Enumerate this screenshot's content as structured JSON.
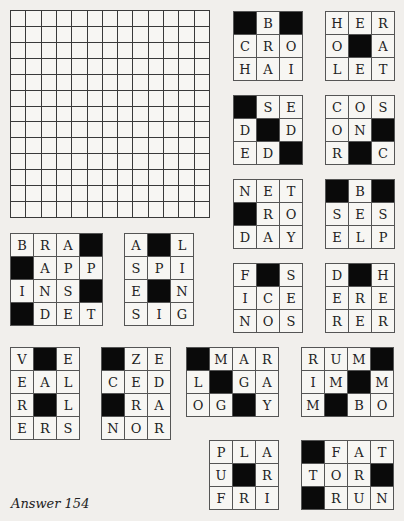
{
  "puzzle": {
    "answer_label": "Answer 154",
    "main_grid": {
      "rows": 13,
      "cols": 13
    },
    "colors": {
      "block": "#0a0a0a",
      "cell": "#f7f6f3",
      "line": "#3a3a3a",
      "page": "#f1efec"
    },
    "pieces": [
      {
        "id": "piece-1",
        "x": 233,
        "y": 11,
        "cols": 3,
        "rows": 3,
        "cells": [
          "#",
          "B",
          "#",
          "C",
          "R",
          "O",
          "H",
          "A",
          "I"
        ]
      },
      {
        "id": "piece-2",
        "x": 325,
        "y": 11,
        "cols": 3,
        "rows": 3,
        "cells": [
          "H",
          "E",
          "R",
          "O",
          "#",
          "A",
          "L",
          "E",
          "T"
        ]
      },
      {
        "id": "piece-3",
        "x": 233,
        "y": 95,
        "cols": 3,
        "rows": 3,
        "cells": [
          "#",
          "S",
          "E",
          "D",
          "#",
          "D",
          "E",
          "D",
          "#"
        ]
      },
      {
        "id": "piece-4",
        "x": 325,
        "y": 95,
        "cols": 3,
        "rows": 3,
        "cells": [
          "C",
          "O",
          "S",
          "O",
          "N",
          "#",
          "R",
          "#",
          "C"
        ]
      },
      {
        "id": "piece-5",
        "x": 233,
        "y": 179,
        "cols": 3,
        "rows": 3,
        "cells": [
          "N",
          "E",
          "T",
          "#",
          "R",
          "O",
          "D",
          "A",
          "Y"
        ]
      },
      {
        "id": "piece-6",
        "x": 325,
        "y": 179,
        "cols": 3,
        "rows": 3,
        "cells": [
          "#",
          "B",
          "#",
          "S",
          "E",
          "S",
          "E",
          "L",
          "P"
        ]
      },
      {
        "id": "piece-7",
        "x": 233,
        "y": 263,
        "cols": 3,
        "rows": 3,
        "cells": [
          "F",
          "#",
          "S",
          "I",
          "C",
          "E",
          "N",
          "O",
          "S"
        ]
      },
      {
        "id": "piece-8",
        "x": 325,
        "y": 263,
        "cols": 3,
        "rows": 3,
        "cells": [
          "D",
          "#",
          "H",
          "E",
          "R",
          "E",
          "R",
          "E",
          "R"
        ]
      },
      {
        "id": "piece-9",
        "x": 10,
        "y": 233,
        "cols": 4,
        "rows": 4,
        "cells": [
          "B",
          "R",
          "A",
          "#",
          "#",
          "A",
          "P",
          "P",
          "I",
          "N",
          "S",
          "#",
          "#",
          "D",
          "E",
          "T"
        ]
      },
      {
        "id": "piece-10",
        "x": 124,
        "y": 233,
        "cols": 3,
        "rows": 4,
        "cells": [
          "A",
          "#",
          "L",
          "S",
          "P",
          "I",
          "E",
          "#",
          "N",
          "S",
          "I",
          "G"
        ]
      },
      {
        "id": "piece-11",
        "x": 10,
        "y": 347,
        "cols": 3,
        "rows": 4,
        "cells": [
          "V",
          "#",
          "E",
          "E",
          "A",
          "L",
          "R",
          "#",
          "L",
          "E",
          "R",
          "S"
        ]
      },
      {
        "id": "piece-12",
        "x": 101,
        "y": 347,
        "cols": 3,
        "rows": 4,
        "cells": [
          "#",
          "Z",
          "E",
          "C",
          "E",
          "D",
          "#",
          "R",
          "A",
          "N",
          "O",
          "R"
        ]
      },
      {
        "id": "piece-13",
        "x": 186,
        "y": 347,
        "cols": 4,
        "rows": 3,
        "cells": [
          "#",
          "M",
          "A",
          "R",
          "L",
          "#",
          "G",
          "A",
          "O",
          "G",
          "#",
          "Y"
        ]
      },
      {
        "id": "piece-14",
        "x": 301,
        "y": 347,
        "cols": 4,
        "rows": 3,
        "cells": [
          "R",
          "U",
          "M",
          "#",
          "I",
          "M",
          "#",
          "M",
          "M",
          "#",
          "B",
          "O"
        ]
      },
      {
        "id": "piece-15",
        "x": 209,
        "y": 440,
        "cols": 3,
        "rows": 3,
        "cells": [
          "P",
          "L",
          "A",
          "U",
          "#",
          "R",
          "F",
          "R",
          "I"
        ]
      },
      {
        "id": "piece-16",
        "x": 301,
        "y": 440,
        "cols": 4,
        "rows": 3,
        "cells": [
          "#",
          "F",
          "A",
          "T",
          "T",
          "O",
          "R",
          "#",
          "#",
          "R",
          "U",
          "N"
        ]
      }
    ]
  }
}
